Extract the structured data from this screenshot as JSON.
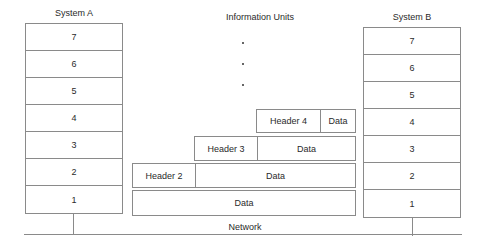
{
  "diagram": {
    "system_a": {
      "title": "System A",
      "layers": [
        "7",
        "6",
        "5",
        "4",
        "3",
        "2",
        "1"
      ]
    },
    "system_b": {
      "title": "System B",
      "layers": [
        "7",
        "6",
        "5",
        "4",
        "3",
        "2",
        "1"
      ]
    },
    "information_units": {
      "title": "Information Units",
      "ellipsis_dots": 3,
      "units": [
        {
          "layer": "4",
          "cells": [
            "Header 4",
            "Data"
          ]
        },
        {
          "layer": "3",
          "cells": [
            "Header 3",
            "Data"
          ]
        },
        {
          "layer": "2",
          "cells": [
            "Header 2",
            "Data"
          ]
        },
        {
          "layer": "1",
          "cells": [
            "Data"
          ]
        }
      ]
    },
    "network": {
      "label": "Network"
    }
  }
}
